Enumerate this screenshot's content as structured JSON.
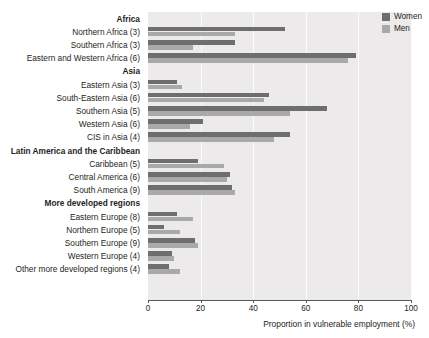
{
  "chart_data": {
    "type": "bar",
    "orientation": "horizontal",
    "title": "",
    "xlabel": "Proportion in vulnerable employment (%)",
    "ylabel": "",
    "xlim": [
      0,
      100
    ],
    "xticks": [
      0,
      20,
      40,
      60,
      80,
      100
    ],
    "grid": "vertical-light",
    "legend_position": "top-right",
    "series": [
      {
        "name": "Women",
        "color": "#6e6e6e"
      },
      {
        "name": "Men",
        "color": "#a9a9a9"
      }
    ],
    "groups": [
      {
        "label": "Africa",
        "rows": [
          {
            "label": "Northern Africa (3)",
            "women": 52,
            "men": 33
          },
          {
            "label": "Southern Africa (3)",
            "women": 33,
            "men": 17
          },
          {
            "label": "Eastern and Western Africa (6)",
            "women": 79,
            "men": 76
          }
        ]
      },
      {
        "label": "Asia",
        "rows": [
          {
            "label": "Eastern Asia (3)",
            "women": 11,
            "men": 13
          },
          {
            "label": "South-Eastern Asia (6)",
            "women": 46,
            "men": 44
          },
          {
            "label": "Southern Asia (5)",
            "women": 68,
            "men": 54
          },
          {
            "label": "Western Asia (6)",
            "women": 21,
            "men": 16
          },
          {
            "label": "CIS in Asia (4)",
            "women": 54,
            "men": 48
          }
        ]
      },
      {
        "label": "Latin America and the Caribbean",
        "rows": [
          {
            "label": "Caribbean (5)",
            "women": 19,
            "men": 29
          },
          {
            "label": "Central America (6)",
            "women": 31,
            "men": 30
          },
          {
            "label": "South America (9)",
            "women": 32,
            "men": 33
          }
        ]
      },
      {
        "label": "More developed regions",
        "rows": [
          {
            "label": "Eastern Europe (8)",
            "women": 11,
            "men": 17
          },
          {
            "label": "Northern Europe (5)",
            "women": 6,
            "men": 12
          },
          {
            "label": "Southern Europe (9)",
            "women": 18,
            "men": 19
          },
          {
            "label": "Western Europe (4)",
            "women": 9,
            "men": 10
          },
          {
            "label": "Other more developed regions (4)",
            "women": 8,
            "men": 12
          }
        ]
      }
    ]
  },
  "legend": {
    "items": [
      {
        "label": "Women"
      },
      {
        "label": "Men"
      }
    ]
  },
  "axis": {
    "x_title": "Proportion in vulnerable employment (%)",
    "ticks": [
      "0",
      "20",
      "40",
      "60",
      "80",
      "100"
    ]
  },
  "colors": {
    "women": "#6e6e6e",
    "men": "#a9a9a9",
    "plot_background": "#eceaea",
    "gridline": "#fbfbfb",
    "axis": "#58595b",
    "text": "#231f20"
  }
}
